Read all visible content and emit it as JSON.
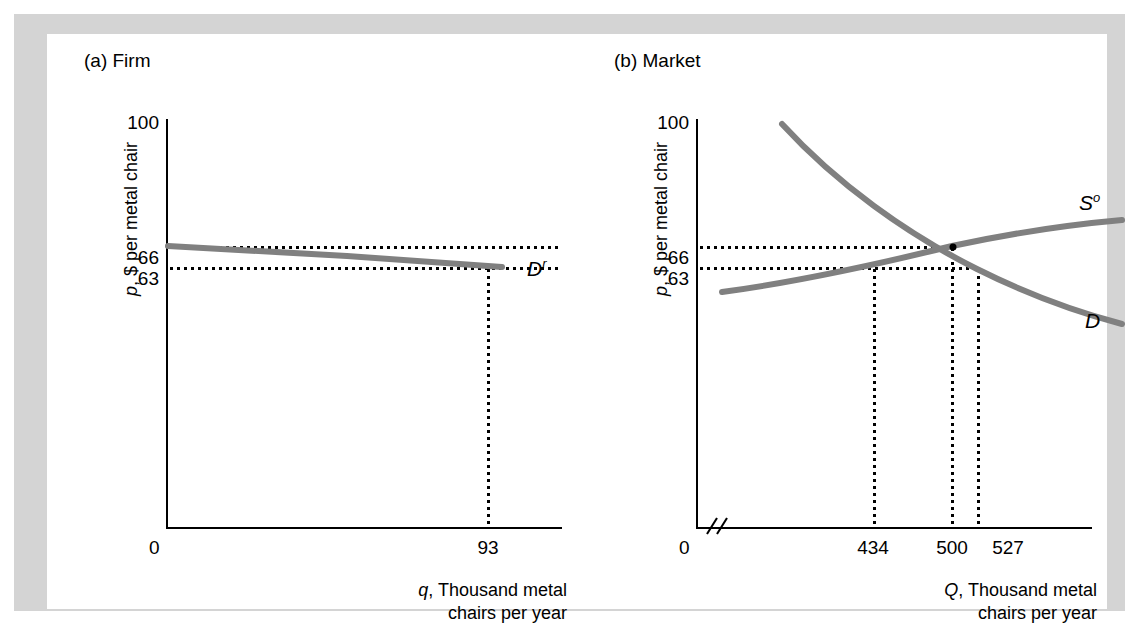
{
  "figure": {
    "background": "#d4d4d4",
    "canvas_background": "#ffffff",
    "curve_color": "#808080",
    "axis_color": "#000000"
  },
  "panels": [
    {
      "key": "firm",
      "title": "(a) Firm",
      "y_axis_title": "p, $ per metal chair",
      "x_axis_title_line1": "q, Thousand metal",
      "x_axis_title_line2": "chairs per year",
      "origin_label": "0",
      "y_ticks": [
        "100",
        "66",
        "63"
      ],
      "x_ticks": [
        "93"
      ],
      "curve_labels": [
        {
          "base": "D",
          "sup": "r"
        }
      ]
    },
    {
      "key": "market",
      "title": "(b) Market",
      "y_axis_title": "p, $ per metal chair",
      "x_axis_title_line1": "Q, Thousand metal",
      "x_axis_title_line2": "chairs per year",
      "origin_label": "0",
      "y_ticks": [
        "100",
        "66",
        "63"
      ],
      "x_ticks": [
        "434",
        "500",
        "527"
      ],
      "curve_labels": [
        {
          "base": "S",
          "sup": "o"
        },
        {
          "base": "D",
          "sup": ""
        }
      ]
    }
  ],
  "chart_data": [
    {
      "type": "line",
      "panel": "(a) Firm",
      "title": "(a) Firm",
      "xlabel": "q, Thousand metal chairs per year",
      "ylabel": "p, $ per metal chair",
      "ylim": [
        0,
        100
      ],
      "ytick_values": [
        100,
        66,
        63,
        0
      ],
      "xtick_values": [
        0,
        93
      ],
      "grid": false,
      "legend": "inline-curve-labels",
      "series": [
        {
          "name": "D^r",
          "label": "Residual demand curve facing the firm",
          "points": [
            [
              0,
              66
            ],
            [
              20,
              65.6
            ],
            [
              40,
              65.0
            ],
            [
              60,
              64.3
            ],
            [
              80,
              63.6
            ],
            [
              98,
              63.0
            ]
          ]
        }
      ],
      "annotations": [
        {
          "type": "dotted-horizontal",
          "value": 66,
          "label": "66"
        },
        {
          "type": "dotted-horizontal",
          "value": 63,
          "label": "63"
        },
        {
          "type": "dotted-vertical",
          "value": 93,
          "label": "93"
        }
      ]
    },
    {
      "type": "line",
      "panel": "(b) Market",
      "title": "(b) Market",
      "xlabel": "Q, Thousand metal chairs per year",
      "ylabel": "p, $ per metal chair",
      "ylim": [
        0,
        100
      ],
      "ytick_values": [
        100,
        66,
        63,
        0
      ],
      "xtick_values": [
        0,
        434,
        500,
        527
      ],
      "axis_break_on_x": true,
      "grid": false,
      "legend": "inline-curve-labels",
      "series": [
        {
          "name": "D",
          "label": "Market demand curve",
          "points": [
            [
              300,
              100
            ],
            [
              360,
              89
            ],
            [
              420,
              79
            ],
            [
              480,
              70
            ],
            [
              540,
              62
            ],
            [
              600,
              55
            ],
            [
              660,
              50
            ]
          ]
        },
        {
          "name": "S^o",
          "label": "Market supply curve (other firms plus this firm)",
          "points": [
            [
              300,
              58
            ],
            [
              380,
              61
            ],
            [
              460,
              64.5
            ],
            [
              500,
              66
            ],
            [
              560,
              69
            ],
            [
              620,
              72
            ],
            [
              670,
              74
            ]
          ]
        }
      ],
      "annotations": [
        {
          "type": "equilibrium-point",
          "x": 500,
          "y": 66,
          "label": "equilibrium"
        },
        {
          "type": "dotted-horizontal",
          "value": 66,
          "label": "66"
        },
        {
          "type": "dotted-horizontal",
          "value": 63,
          "label": "63"
        },
        {
          "type": "dotted-vertical",
          "value": 434,
          "label": "434"
        },
        {
          "type": "dotted-vertical",
          "value": 500,
          "label": "500"
        },
        {
          "type": "dotted-vertical",
          "value": 527,
          "label": "527"
        }
      ]
    }
  ]
}
